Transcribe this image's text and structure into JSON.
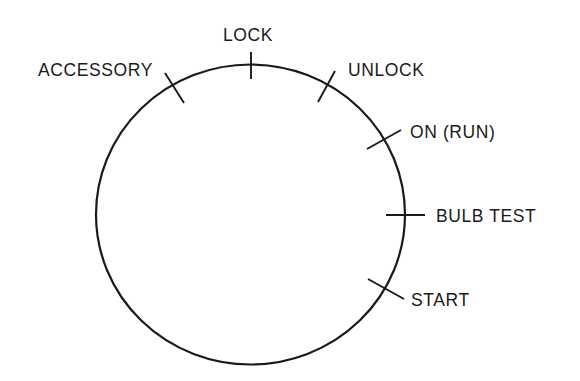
{
  "diagram": {
    "dial": {
      "cx": 250.5,
      "cy": 214.5,
      "rx": 154.5,
      "ry": 150
    },
    "positions": [
      {
        "id": "accessory",
        "label": "ACCESSORY",
        "tick": {
          "x1": 165,
          "y1": 73,
          "x2": 184,
          "y2": 103
        },
        "text": {
          "x": 38,
          "y": 76,
          "anchor": "start"
        }
      },
      {
        "id": "lock",
        "label": "LOCK",
        "tick": {
          "x1": 251,
          "y1": 52,
          "x2": 251,
          "y2": 79
        },
        "text": {
          "x": 223,
          "y": 41,
          "anchor": "start"
        }
      },
      {
        "id": "unlock",
        "label": "UNLOCK",
        "tick": {
          "x1": 335,
          "y1": 71,
          "x2": 318,
          "y2": 102
        },
        "text": {
          "x": 348,
          "y": 76,
          "anchor": "start"
        }
      },
      {
        "id": "on-run",
        "label": "ON (RUN)",
        "tick": {
          "x1": 367,
          "y1": 149,
          "x2": 401,
          "y2": 130
        },
        "text": {
          "x": 410,
          "y": 138,
          "anchor": "start"
        }
      },
      {
        "id": "bulb-test",
        "label": "BULB TEST",
        "tick": {
          "x1": 386,
          "y1": 215,
          "x2": 425,
          "y2": 215
        },
        "text": {
          "x": 436,
          "y": 222,
          "anchor": "start"
        }
      },
      {
        "id": "start",
        "label": "START",
        "tick": {
          "x1": 368,
          "y1": 279,
          "x2": 404,
          "y2": 299
        },
        "text": {
          "x": 411,
          "y": 306,
          "anchor": "start"
        }
      }
    ]
  }
}
